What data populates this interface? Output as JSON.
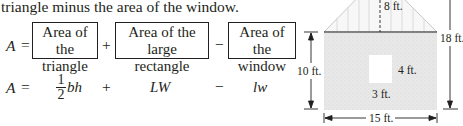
{
  "intro_text": "triangle minus the area of the window.",
  "verbal_equation": {
    "lhs": "A",
    "equals": "=",
    "terms": [
      {
        "line1": "Area of the",
        "line2": "triangle"
      },
      {
        "line1": "Area of the large",
        "line2": "rectangle"
      },
      {
        "line1": "Area of the",
        "line2": "window"
      }
    ],
    "operators": [
      "+",
      "−"
    ]
  },
  "symbolic_equation": {
    "lhs": "A",
    "equals": "=",
    "frac_num": "1",
    "frac_den": "2",
    "term1": "bh",
    "op1": "+",
    "term2": "LW",
    "op2": "−",
    "term3": "lw"
  },
  "figure": {
    "label_roof_height": "8 ft.",
    "label_total_height": "18 ft.",
    "label_wall_height": "10 ft.",
    "label_width": "15 ft.",
    "label_window_height": "4 ft.",
    "label_window_width": "3 ft.",
    "colors": {
      "wall_fill": "#e6e6e6",
      "roof_fill": "#f4f4f4",
      "line": "#231f20"
    }
  }
}
